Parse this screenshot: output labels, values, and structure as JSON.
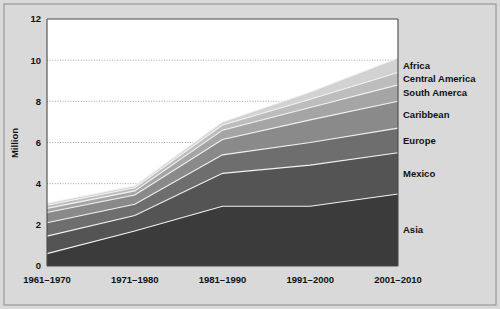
{
  "chart_data": {
    "type": "area",
    "stacked": true,
    "title": "",
    "subtitle": "",
    "xlabel": "",
    "ylabel": "Million",
    "categories": [
      "1961–1970",
      "1971–1980",
      "1981–1990",
      "1991–2000",
      "2001–2010"
    ],
    "ylim": [
      0,
      12
    ],
    "yticks": [
      0,
      2,
      4,
      6,
      8,
      10,
      12
    ],
    "ytick_labels": [
      "0",
      "2",
      "4",
      "6",
      "8",
      "10",
      "12"
    ],
    "grid": true,
    "grid_axis": "y",
    "legend_position": "right-inline",
    "series": [
      {
        "name": "Asia",
        "color": "#3b3b3b",
        "values": [
          0.6,
          1.7,
          2.9,
          2.9,
          3.5
        ],
        "cumulative_top": [
          0.6,
          1.7,
          2.9,
          2.9,
          3.5
        ]
      },
      {
        "name": "Mexico",
        "color": "#545454",
        "values": [
          0.85,
          0.75,
          1.6,
          2.0,
          2.0
        ],
        "cumulative_top": [
          1.45,
          2.45,
          4.5,
          4.9,
          5.5
        ]
      },
      {
        "name": "Europe",
        "color": "#6e6e6e",
        "values": [
          0.65,
          0.55,
          0.9,
          1.1,
          1.2
        ],
        "cumulative_top": [
          2.1,
          3.0,
          5.4,
          6.0,
          6.7
        ]
      },
      {
        "name": "Caribbean",
        "color": "#8a8a8a",
        "values": [
          0.5,
          0.45,
          0.75,
          1.1,
          1.3
        ],
        "cumulative_top": [
          2.6,
          3.45,
          6.15,
          7.1,
          8.0
        ]
      },
      {
        "name": "South Amerca",
        "color": "#a5a5a5",
        "values": [
          0.2,
          0.2,
          0.45,
          0.6,
          0.8
        ],
        "cumulative_top": [
          2.8,
          3.65,
          6.6,
          7.7,
          8.8
        ]
      },
      {
        "name": "Central America",
        "color": "#bdbdbd",
        "values": [
          0.15,
          0.15,
          0.25,
          0.4,
          0.6
        ],
        "cumulative_top": [
          2.95,
          3.8,
          6.85,
          8.1,
          9.4
        ]
      },
      {
        "name": "Africa",
        "color": "#d2d2d2",
        "values": [
          0.1,
          0.1,
          0.15,
          0.35,
          0.7
        ],
        "cumulative_top": [
          3.05,
          3.9,
          7.0,
          8.45,
          10.1
        ]
      }
    ],
    "colors": {
      "panel_background": "#ffffff",
      "figure_background": "#d9d9d9",
      "axis": "#4a4a4a",
      "gridline": "#9a9a9a",
      "separator": "#f2f2f2",
      "text": "#111111"
    }
  }
}
